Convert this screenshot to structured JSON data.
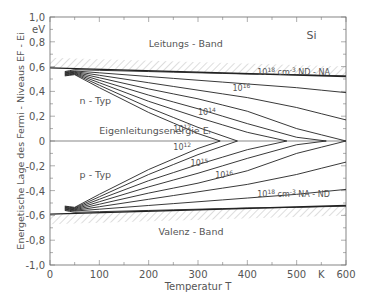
{
  "chart_data": {
    "type": "line",
    "title": "Si",
    "xlabel": "Temperatur T",
    "x_unit": "K",
    "ylabel": "Energetische Lage des Fermi-Niveaus  E_F - E_i",
    "y_unit": "eV",
    "xlim": [
      0,
      600
    ],
    "ylim": [
      -1.0,
      1.0
    ],
    "x_ticks": [
      0,
      100,
      200,
      300,
      400,
      500,
      600
    ],
    "x_tick_labels": [
      "0",
      "100",
      "200",
      "300",
      "400",
      "500",
      "K",
      "600"
    ],
    "y_ticks": [
      1.0,
      0.8,
      0.6,
      0.4,
      0.2,
      0,
      -0.2,
      -0.4,
      -0.6,
      -0.8,
      -1.0
    ],
    "y_tick_labels": [
      "1,0",
      "0,8",
      "0,6",
      "0,4",
      "0,2",
      "0",
      "-0,2",
      "-0,4",
      "-0,6",
      "-0,8",
      "-1,0"
    ],
    "grid": false,
    "annotations": [
      {
        "text": "Leitungs - Band",
        "x": 200,
        "y": 0.76
      },
      {
        "text": "Valenz - Band",
        "x": 220,
        "y": -0.76
      },
      {
        "text": "n - Typ",
        "x": 60,
        "y": 0.3
      },
      {
        "text": "p - Typ",
        "x": 60,
        "y": -0.3
      },
      {
        "text": "Eigenleitungsenergie  E_i",
        "x": 100,
        "y": 0.06
      },
      {
        "text": "Si",
        "x": 520,
        "y": 0.82
      }
    ],
    "band_edges": {
      "conduction": {
        "x": [
          0,
          600
        ],
        "y": [
          0.59,
          0.52
        ]
      },
      "valence": {
        "x": [
          0,
          600
        ],
        "y": [
          -0.59,
          -0.52
        ]
      }
    },
    "series": [
      {
        "name": "n 10^18 cm^-3 N_D-N_A",
        "x": [
          30,
          50,
          100,
          200,
          300,
          400,
          500,
          600
        ],
        "y": [
          0.56,
          0.575,
          0.57,
          0.56,
          0.55,
          0.54,
          0.535,
          0.525
        ]
      },
      {
        "name": "n 10^17",
        "x": [
          30,
          50,
          100,
          200,
          300,
          400,
          500,
          600
        ],
        "y": [
          0.555,
          0.565,
          0.55,
          0.52,
          0.49,
          0.46,
          0.43,
          0.39
        ]
      },
      {
        "name": "n 10^16",
        "x": [
          30,
          50,
          100,
          200,
          300,
          400,
          500,
          600
        ],
        "y": [
          0.55,
          0.56,
          0.53,
          0.47,
          0.41,
          0.35,
          0.27,
          0.17
        ]
      },
      {
        "name": "n 10^15",
        "x": [
          30,
          50,
          100,
          200,
          300,
          400,
          500,
          600
        ],
        "y": [
          0.545,
          0.555,
          0.51,
          0.42,
          0.34,
          0.24,
          0.1,
          0.0
        ]
      },
      {
        "name": "n 10^14",
        "x": [
          30,
          50,
          100,
          200,
          300,
          400,
          500,
          560
        ],
        "y": [
          0.54,
          0.55,
          0.49,
          0.37,
          0.26,
          0.14,
          0.03,
          0.0
        ]
      },
      {
        "name": "n 10^13",
        "x": [
          30,
          50,
          100,
          200,
          300,
          400,
          480
        ],
        "y": [
          0.535,
          0.545,
          0.47,
          0.32,
          0.19,
          0.07,
          0.0
        ]
      },
      {
        "name": "n 10^12",
        "x": [
          30,
          50,
          100,
          200,
          300,
          380
        ],
        "y": [
          0.53,
          0.54,
          0.45,
          0.27,
          0.11,
          0.0
        ]
      },
      {
        "name": "n 10^11",
        "x": [
          30,
          50,
          100,
          200,
          300,
          345
        ],
        "y": [
          0.525,
          0.535,
          0.43,
          0.23,
          0.06,
          0.0
        ]
      },
      {
        "name": "p 10^18 cm^-3 N_A-N_D",
        "x": [
          30,
          50,
          100,
          200,
          300,
          400,
          500,
          600
        ],
        "y": [
          -0.56,
          -0.575,
          -0.57,
          -0.56,
          -0.55,
          -0.54,
          -0.535,
          -0.525
        ]
      },
      {
        "name": "p 10^17",
        "x": [
          30,
          50,
          100,
          200,
          300,
          400,
          500,
          600
        ],
        "y": [
          -0.555,
          -0.565,
          -0.55,
          -0.52,
          -0.49,
          -0.46,
          -0.43,
          -0.39
        ]
      },
      {
        "name": "p 10^16",
        "x": [
          30,
          50,
          100,
          200,
          300,
          400,
          500,
          600
        ],
        "y": [
          -0.55,
          -0.56,
          -0.53,
          -0.47,
          -0.41,
          -0.35,
          -0.27,
          -0.17
        ]
      },
      {
        "name": "p 10^15",
        "x": [
          30,
          50,
          100,
          200,
          300,
          400,
          500,
          600
        ],
        "y": [
          -0.545,
          -0.555,
          -0.51,
          -0.42,
          -0.34,
          -0.24,
          -0.1,
          0.0
        ]
      },
      {
        "name": "p 10^14",
        "x": [
          30,
          50,
          100,
          200,
          300,
          400,
          500,
          560
        ],
        "y": [
          -0.54,
          -0.55,
          -0.49,
          -0.37,
          -0.26,
          -0.14,
          -0.03,
          0.0
        ]
      },
      {
        "name": "p 10^13",
        "x": [
          30,
          50,
          100,
          200,
          300,
          400,
          480
        ],
        "y": [
          -0.535,
          -0.545,
          -0.47,
          -0.32,
          -0.19,
          -0.07,
          0.0
        ]
      },
      {
        "name": "p 10^12",
        "x": [
          30,
          50,
          100,
          200,
          300,
          380
        ],
        "y": [
          -0.53,
          -0.54,
          -0.45,
          -0.27,
          -0.11,
          0.0
        ]
      },
      {
        "name": "p 10^11",
        "x": [
          30,
          50,
          100,
          200,
          300,
          345
        ],
        "y": [
          -0.525,
          -0.535,
          -0.43,
          -0.23,
          -0.06,
          0.0
        ]
      }
    ],
    "curve_labels": [
      {
        "text": "10^18 cm^-3  N_D-N_A",
        "x": 420,
        "y": 0.53
      },
      {
        "text": "10^16",
        "x": 370,
        "y": 0.4
      },
      {
        "text": "10^14",
        "x": 300,
        "y": 0.21
      },
      {
        "text": "10^12",
        "x": 250,
        "y": 0.07
      },
      {
        "text": "10^12",
        "x": 250,
        "y": -0.07
      },
      {
        "text": "10^15",
        "x": 285,
        "y": -0.2
      },
      {
        "text": "10^16",
        "x": 335,
        "y": -0.3
      },
      {
        "text": "10^18 cm^-3  N_A-N_D",
        "x": 420,
        "y": -0.45
      }
    ]
  }
}
